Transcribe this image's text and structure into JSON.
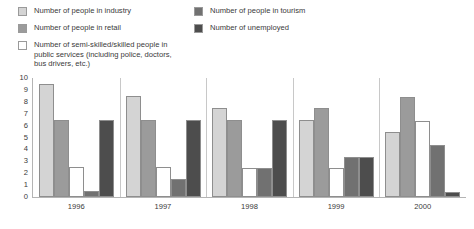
{
  "legend": {
    "columns": [
      {
        "items": [
          {
            "label": "Number of people in industry",
            "color": "#d4d4d4",
            "icon": "legend-swatch-industry"
          },
          {
            "label": "Number of people in retail",
            "color": "#9b9b9b",
            "icon": "legend-swatch-retail"
          },
          {
            "label": "Number of semi-skilled/skilled people in\npublic services (including police, doctors,\nbus drivers, etc.)",
            "color": "#ffffff",
            "icon": "legend-swatch-public-services"
          }
        ]
      },
      {
        "items": [
          {
            "label": "Number of people in  tourism",
            "color": "#717171",
            "icon": "legend-swatch-tourism"
          },
          {
            "label": "Number of unemployed",
            "color": "#4d4d4d",
            "icon": "legend-swatch-unemployed"
          }
        ]
      }
    ]
  },
  "chart_data": {
    "type": "bar",
    "title": "",
    "subtitle": "",
    "xlabel": "",
    "ylabel": "",
    "ylim": [
      0,
      10
    ],
    "yticks": [
      "10",
      "9",
      "8",
      "7",
      "6",
      "5",
      "4",
      "3",
      "2",
      "1",
      "0"
    ],
    "grid": false,
    "legend_position": "top",
    "categories": [
      "1996",
      "1997",
      "1998",
      "1999",
      "2000"
    ],
    "series": [
      {
        "name": "Number of people in industry",
        "color": "#d4d4d4",
        "values": [
          9.5,
          8.5,
          7.5,
          6.5,
          5.5
        ]
      },
      {
        "name": "Number of people in retail",
        "color": "#9b9b9b",
        "values": [
          6.5,
          6.5,
          6.5,
          7.5,
          8.4
        ]
      },
      {
        "name": "Number of semi-skilled/skilled people in public services (including police, doctors, bus drivers, etc.)",
        "color": "#ffffff",
        "values": [
          2.5,
          2.5,
          2.4,
          2.4,
          6.4
        ]
      },
      {
        "name": "Number of people in  tourism",
        "color": "#717171",
        "values": [
          0.5,
          1.5,
          2.4,
          3.4,
          4.4
        ]
      },
      {
        "name": "Number of unemployed",
        "color": "#4d4d4d",
        "values": [
          6.5,
          6.5,
          6.5,
          3.4,
          0.4
        ]
      }
    ]
  }
}
